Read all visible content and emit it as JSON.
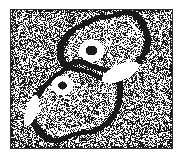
{
  "figure": {
    "domain": "Natural-Image",
    "kind": "electron-micrograph",
    "subject": "two dividing coccoid cells forming a figure-eight pair",
    "caption": "",
    "background_texture": "dense black-and-white dithered stipple noise",
    "plate": {
      "x": 10,
      "y": 9,
      "width": 163,
      "height": 140,
      "border_color": "#2b2b2b",
      "border_width_px": 1,
      "page_background": "#ffffff"
    },
    "colors": {
      "ink_black": "#1a1a1a",
      "paper_white": "#ffffff",
      "mid_grey": "#9a9a9a",
      "plate_border": "#2b2b2b"
    },
    "noise": {
      "density": 0.5,
      "cell_size_px": 1,
      "seed": 20240711
    },
    "cells": [
      {
        "name": "upper-right-cell",
        "cx": 106,
        "cy": 45,
        "rx": 45,
        "ry": 30,
        "rotation_deg": -14,
        "wall_thickness_px": 5,
        "interior_shade": 0.42,
        "spot": {
          "cx": 91,
          "cy": 50,
          "r": 5.5,
          "halo_r": 12.5
        }
      },
      {
        "name": "lower-left-cell",
        "cx": 76,
        "cy": 101,
        "rx": 48,
        "ry": 34,
        "rotation_deg": -28,
        "wall_thickness_px": 5,
        "interior_shade": 0.44,
        "spot": {
          "cx": 62,
          "cy": 85,
          "r": 4.5,
          "halo_r": 11.0
        }
      }
    ],
    "highlights": [
      {
        "name": "septum-white-crescent-right",
        "cx": 120,
        "cy": 72,
        "rx": 20,
        "ry": 8,
        "rotation_deg": -24
      },
      {
        "name": "white-crescent-lower-left",
        "cx": 31,
        "cy": 110,
        "rx": 6,
        "ry": 16,
        "rotation_deg": 18
      }
    ],
    "septum": {
      "name": "dividing-septum-band",
      "description": "dark S-shaped band where the two cell walls meet in the middle"
    }
  }
}
